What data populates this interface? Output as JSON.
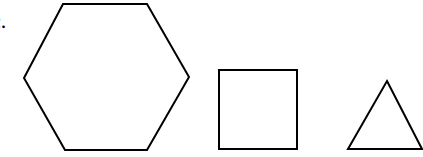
{
  "figure": {
    "label": "c.",
    "stroke_color": "#000000",
    "fill_color": "#ffffff",
    "stroke_width": 2,
    "shapes": [
      {
        "name": "hexagon",
        "points": "63,4 147,4 189,77 147,150 65,150 24,78"
      },
      {
        "name": "square",
        "x": 219,
        "y": 70,
        "width": 78,
        "height": 79
      },
      {
        "name": "triangle",
        "points": "387,81 422,149 348,149"
      }
    ]
  }
}
